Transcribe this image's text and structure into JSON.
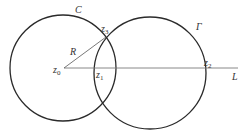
{
  "diagram": {
    "colors": {
      "circle": "#2a2a2a",
      "line": "#7a7a7a",
      "radius": "#555555",
      "text": "#333333"
    },
    "circles": [
      {
        "name": "C",
        "label": "C",
        "cx": 63,
        "cy": 68,
        "r": 53
      },
      {
        "name": "Gamma",
        "label": "Γ",
        "cx": 150,
        "cy": 73,
        "r": 56
      }
    ],
    "line": {
      "label": "L",
      "x1": 64,
      "y1": 68,
      "x2": 238,
      "y2": 68
    },
    "radius": {
      "label": "R",
      "x1": 64,
      "y1": 68,
      "x2": 106,
      "y2": 37
    },
    "points": [
      {
        "base": "z",
        "sub": "0",
        "x": 53,
        "y": 73
      },
      {
        "base": "z",
        "sub": "1",
        "x": 96,
        "y": 78
      },
      {
        "base": "z",
        "sub": "2",
        "x": 204,
        "y": 66
      },
      {
        "base": "z",
        "sub": "3",
        "x": 101,
        "y": 32
      }
    ],
    "labels": {
      "C": {
        "text": "C",
        "x": 75,
        "y": 13
      },
      "Gamma": {
        "text": "Γ",
        "x": 196,
        "y": 30
      },
      "R": {
        "text": "R",
        "x": 70,
        "y": 55
      },
      "L": {
        "text": "L",
        "x": 232,
        "y": 80
      }
    }
  }
}
